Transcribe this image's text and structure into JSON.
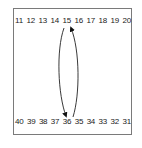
{
  "diagram": {
    "top_row": [
      "11",
      "12",
      "13",
      "14",
      "15",
      "16",
      "17",
      "18",
      "19",
      "20"
    ],
    "bottom_row": [
      "40",
      "39",
      "38",
      "37",
      "36",
      "35",
      "34",
      "33",
      "32",
      "31"
    ],
    "arrows": [
      {
        "from": "15",
        "to": "36",
        "direction": "down"
      },
      {
        "from": "36",
        "to": "15",
        "direction": "up"
      }
    ]
  }
}
